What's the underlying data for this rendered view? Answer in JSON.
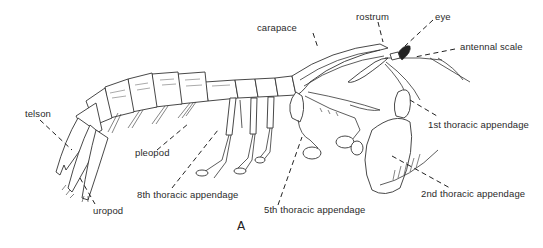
{
  "figure": {
    "panel_label": "A",
    "labels": {
      "telson": "telson",
      "uropod": "uropod",
      "pleopod": "pleopod",
      "eighth_thoracic": "8th thoracic appendage",
      "fifth_thoracic": "5th thoracic appendage",
      "carapace": "carapace",
      "rostrum": "rostrum",
      "eye": "eye",
      "antennal_scale": "antennal scale",
      "first_thoracic": "1st thoracic appendage",
      "second_thoracic": "2nd thoracic appendage"
    }
  }
}
